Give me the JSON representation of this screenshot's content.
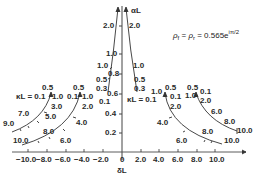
{
  "diagram": {
    "formula": {
      "lhs": "ρ",
      "sub1": "f",
      "eq": " = ",
      "rhs_rho": "ρ",
      "sub2": "r",
      "value": " = 0.565e",
      "exponent": "iπ/2"
    },
    "axes": {
      "x_label": "δL",
      "y_label": "αL",
      "x_ticks": [
        "−10.0",
        "−8.0",
        "−6.0",
        "−4.0",
        "−2.0",
        "0",
        "2.0",
        "4.0",
        "6.0",
        "8.0",
        "10.0"
      ],
      "y_ticks": [
        "0.2",
        "0.4",
        "0.6",
        "0.8",
        "1.0",
        "2.0"
      ]
    },
    "center_left_curve": {
      "labels": [
        "2.0",
        "1.0",
        "0.5",
        "0.3",
        "0.1"
      ]
    },
    "center_right_curve": {
      "labels": [
        "2.0",
        "1.0",
        "0.5",
        "0.3"
      ],
      "kl_label": "κL = 0.1"
    },
    "left_inner_curve": {
      "kl_label": "κL = 0.1",
      "labels": [
        "0.5",
        "1.0",
        "3.0",
        "5.0",
        "7.0",
        "9.0"
      ]
    },
    "left_outer_curve": {
      "labels": [
        "0.5",
        "0.1",
        "1.0",
        "2.0",
        "4.0",
        "6.0",
        "8.0",
        "10.0"
      ]
    },
    "right_inner_curve": {
      "labels": [
        "0.5",
        "1.0",
        "0.1",
        "2.0",
        "4.0",
        "6.0",
        "8.0",
        "10.0"
      ]
    },
    "right_outer_curve": {
      "labels": [
        "0.5",
        "1.0",
        "0.1",
        "2.0",
        "6.0",
        "8.0",
        "10.0"
      ]
    }
  }
}
